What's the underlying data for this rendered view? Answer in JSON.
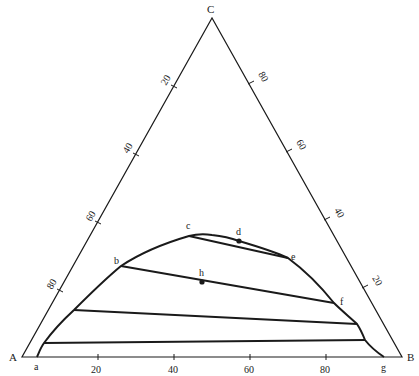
{
  "diagram": {
    "type": "ternary-phase-diagram",
    "vertices": {
      "A": {
        "label": "A",
        "x": 22,
        "y": 357
      },
      "B": {
        "label": "B",
        "x": 402,
        "y": 357
      },
      "C": {
        "label": "C",
        "x": 212,
        "y": 18
      }
    },
    "axes": {
      "bottom": {
        "from": "A",
        "to": "B",
        "ticks": [
          "20",
          "40",
          "60",
          "80"
        ]
      },
      "left": {
        "from": "C",
        "to": "A",
        "ticks": [
          "20",
          "40",
          "60",
          "80"
        ]
      },
      "right": {
        "from": "B",
        "to": "C",
        "ticks": [
          "20",
          "40",
          "60",
          "80"
        ]
      }
    },
    "binodal_curve": {
      "points": [
        [
          37,
          357
        ],
        [
          44,
          343
        ],
        [
          74,
          310
        ],
        [
          121,
          266
        ],
        [
          189,
          236
        ],
        [
          212,
          235
        ],
        [
          239,
          241
        ],
        [
          288,
          258
        ],
        [
          334,
          303
        ],
        [
          357,
          324
        ],
        [
          365,
          340
        ],
        [
          384,
          357
        ]
      ]
    },
    "point_labels": [
      {
        "id": "a",
        "label": "a",
        "x": 34,
        "y": 370
      },
      {
        "id": "b",
        "label": "b",
        "x": 114,
        "y": 264
      },
      {
        "id": "c",
        "label": "c",
        "x": 186,
        "y": 227
      },
      {
        "id": "d",
        "label": "d",
        "x": 236,
        "y": 234
      },
      {
        "id": "e",
        "label": "e",
        "x": 291,
        "y": 259
      },
      {
        "id": "f",
        "label": "f",
        "x": 340,
        "y": 305
      },
      {
        "id": "g",
        "label": "g",
        "x": 381,
        "y": 370
      },
      {
        "id": "h",
        "label": "h",
        "x": 202,
        "y": 275
      }
    ],
    "marked_points": [
      {
        "id": "d",
        "x": 239,
        "y": 241
      },
      {
        "id": "h",
        "x": 202,
        "y": 282
      }
    ],
    "tie_lines": [
      {
        "from": [
          189,
          236
        ],
        "to": [
          288,
          258
        ],
        "name": "c-e"
      },
      {
        "from": [
          121,
          266
        ],
        "to": [
          334,
          303
        ],
        "name": "b-f"
      },
      {
        "from": [
          74,
          310
        ],
        "to": [
          357,
          324
        ],
        "name": "lower-1"
      },
      {
        "from": [
          44,
          343
        ],
        "to": [
          365,
          340
        ],
        "name": "lower-2"
      }
    ],
    "colors": {
      "line": "#1a1a1a",
      "background": "#ffffff"
    }
  }
}
